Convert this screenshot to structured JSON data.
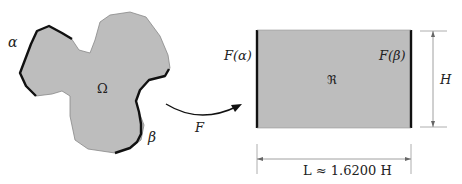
{
  "figure": {
    "source_domain": {
      "name": "Omega",
      "label": "Ω",
      "fill": "#bdbdbd",
      "arc_labels": {
        "alpha": "α",
        "beta": "β"
      }
    },
    "mapping": {
      "label": "F"
    },
    "target_rectangle": {
      "label": "ℜ",
      "fill": "#bdbdbd",
      "left_edge_label": "F(α)",
      "right_edge_label": "F(β)"
    },
    "dimensions": {
      "height_label": "H",
      "length_label": "L ≈ 1.6200 H"
    }
  }
}
